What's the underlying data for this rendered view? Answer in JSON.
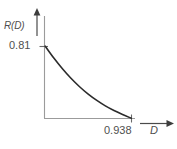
{
  "chart_data": {
    "type": "line",
    "title": "",
    "subtitle": "",
    "xlabel": "D",
    "ylabel": "R(D)",
    "x_tick_labels": [
      "0.938"
    ],
    "y_tick_labels": [
      "0.81"
    ],
    "x_ticks": [
      0.938
    ],
    "y_ticks": [
      0.81
    ],
    "xlim": [
      0,
      1.12
    ],
    "ylim": [
      0,
      0.96
    ],
    "grid": false,
    "legend": false,
    "legend_position": "none",
    "axes_style": "arrow-axes",
    "series": [
      {
        "name": "R(D)",
        "x": [
          0.0,
          0.094,
          0.188,
          0.281,
          0.375,
          0.469,
          0.563,
          0.656,
          0.75,
          0.844,
          0.938
        ],
        "y": [
          0.81,
          0.676,
          0.556,
          0.449,
          0.354,
          0.271,
          0.2,
          0.139,
          0.087,
          0.042,
          0.0
        ]
      }
    ],
    "annotations": [
      {
        "name": "y-intercept",
        "x": 0.0,
        "y": 0.81,
        "text": "0.81"
      },
      {
        "name": "x-intercept",
        "x": 0.938,
        "y": 0.0,
        "text": "0.938"
      }
    ],
    "colors": {
      "curve": "#2b2b2b",
      "axis": "#9b9b9b",
      "arrow": "#3d3d3d",
      "tick": "#6b6b6b",
      "label_text": "#4f4f4f",
      "background": "#ffffff"
    }
  },
  "labels": {
    "y_axis_name": "R(D)",
    "x_axis_name": "D",
    "y_tick_value": "0.81",
    "x_tick_value": "0.938"
  },
  "icons": {
    "y_axis_arrow": "arrow-up-icon",
    "x_axis_arrow": "arrow-right-icon"
  }
}
